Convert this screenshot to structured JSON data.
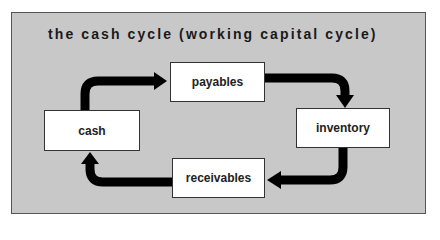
{
  "diagram": {
    "title": "the cash cycle (working capital cycle)",
    "colors": {
      "panel_background": "#c8c8c8",
      "panel_border": "#555555",
      "node_background": "#ffffff",
      "arrow": "#000000",
      "text": "#1a1a1a"
    },
    "nodes": [
      {
        "id": "cash",
        "label": "cash"
      },
      {
        "id": "payables",
        "label": "payables"
      },
      {
        "id": "inventory",
        "label": "inventory"
      },
      {
        "id": "receivables",
        "label": "receivables"
      }
    ],
    "edges": [
      {
        "from": "cash",
        "to": "payables"
      },
      {
        "from": "payables",
        "to": "inventory"
      },
      {
        "from": "inventory",
        "to": "receivables"
      },
      {
        "from": "receivables",
        "to": "cash"
      }
    ]
  }
}
